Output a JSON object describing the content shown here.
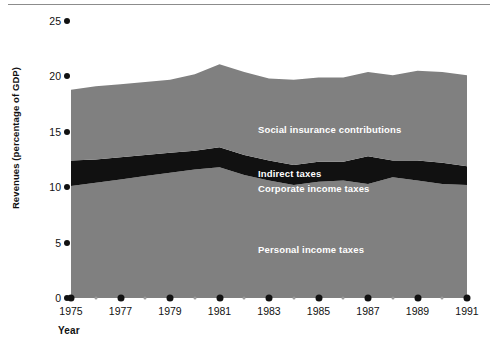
{
  "chart_data": {
    "type": "area",
    "title": "",
    "subtitle": "",
    "xlabel": "Year",
    "ylabel": "Revenues (percentage of GDP)",
    "xlim": [
      1975,
      1991
    ],
    "ylim": [
      0,
      25
    ],
    "ytick_values": [
      0,
      5,
      10,
      15,
      20,
      25
    ],
    "ytick_labels": [
      "0",
      "5",
      "10",
      "15",
      "20",
      "25"
    ],
    "xtick_values": [
      1975,
      1976,
      1977,
      1978,
      1979,
      1980,
      1981,
      1982,
      1983,
      1984,
      1985,
      1986,
      1987,
      1988,
      1989,
      1990,
      1991
    ],
    "xtick_labels_major": [
      "1975",
      "1977",
      "1979",
      "1981",
      "1983",
      "1985",
      "1987",
      "1989",
      "1991"
    ],
    "grid": false,
    "legend_position": "inside-plot",
    "stacked": true,
    "x": [
      1975,
      1976,
      1977,
      1978,
      1979,
      1980,
      1981,
      1982,
      1983,
      1984,
      1985,
      1986,
      1987,
      1988,
      1989,
      1990,
      1991
    ],
    "series": [
      {
        "name": "Personal income taxes",
        "color": "#808080",
        "label_color": "#ffffff",
        "cumulative_top": [
          10.1,
          10.4,
          10.7,
          11.0,
          11.3,
          11.6,
          11.8,
          11.1,
          10.6,
          10.2,
          10.5,
          10.6,
          10.3,
          10.9,
          10.6,
          10.3,
          10.2
        ]
      },
      {
        "name": "Corporate income taxes",
        "color": "#808080",
        "label_color": "#ffffff",
        "note": "rendered within the same grey band below the indirect-taxes stripe"
      },
      {
        "name": "Indirect taxes",
        "color": "#111111",
        "label_color": "#ffffff",
        "cumulative_top": [
          12.4,
          12.5,
          12.7,
          12.9,
          13.1,
          13.3,
          13.6,
          12.9,
          12.4,
          12.0,
          12.3,
          12.3,
          12.8,
          12.4,
          12.4,
          12.2,
          11.9
        ]
      },
      {
        "name": "Social insurance contributions",
        "color": "#808080",
        "label_color": "#ffffff",
        "cumulative_top": [
          18.8,
          19.1,
          19.3,
          19.5,
          19.7,
          20.2,
          21.1,
          20.4,
          19.8,
          19.7,
          19.9,
          19.9,
          20.4,
          20.1,
          20.5,
          20.4,
          20.1
        ]
      }
    ],
    "series_label_positions": [
      {
        "name": "Social insurance contributions",
        "x": 1986.2,
        "y": 15.3
      },
      {
        "name": "Indirect taxes",
        "x": 1986.2,
        "y": 11.3
      },
      {
        "name": "Corporate income taxes",
        "x": 1986.2,
        "y": 10.0
      },
      {
        "name": "Personal income taxes",
        "x": 1986.2,
        "y": 5.4
      }
    ],
    "colors": {
      "area_grey": "#808080",
      "indirect_band": "#111111",
      "background": "#ffffff",
      "axis_text": "#111111",
      "label_text": "#ffffff",
      "minor_tick": "#9a9a9a"
    }
  }
}
